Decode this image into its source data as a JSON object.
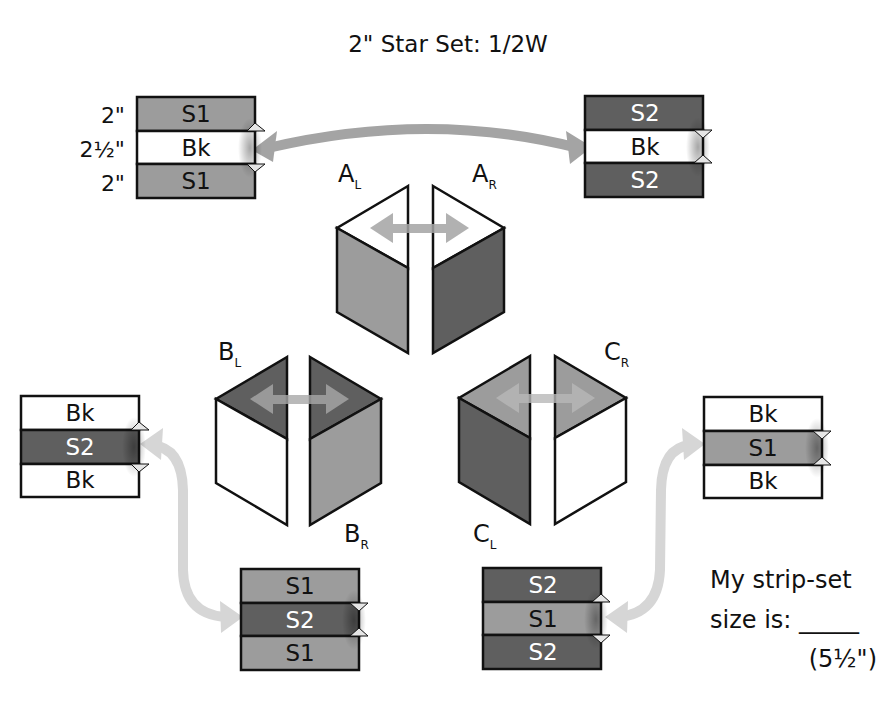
{
  "title": "2\" Star Set: 1/2W",
  "colors": {
    "s1": "#9c9c9c",
    "s2": "#5f5f5f",
    "bk": "#ffffff",
    "outline": "#111111",
    "arrow_dark": "#a4a4a4",
    "arrow_light": "#d4d4d4"
  },
  "dimensions": [
    "2\"",
    "2½\"",
    "2\""
  ],
  "units": {
    "A": {
      "left_label": "A",
      "left_sub": "L",
      "right_label": "A",
      "right_sub": "R"
    },
    "B": {
      "left_label": "B",
      "left_sub": "L",
      "right_label": "B",
      "right_sub": "R"
    },
    "C": {
      "left_label": "C",
      "left_sub": "L",
      "right_label": "C",
      "right_sub": "R"
    }
  },
  "strip_sets": [
    {
      "id": "top-left",
      "strips": [
        "S1",
        "Bk",
        "S1"
      ]
    },
    {
      "id": "top-right",
      "strips": [
        "S2",
        "Bk",
        "S2"
      ]
    },
    {
      "id": "mid-left",
      "strips": [
        "Bk",
        "S2",
        "Bk"
      ]
    },
    {
      "id": "mid-right",
      "strips": [
        "Bk",
        "S1",
        "Bk"
      ]
    },
    {
      "id": "bottom-left",
      "strips": [
        "S1",
        "S2",
        "S1"
      ]
    },
    {
      "id": "bottom-right",
      "strips": [
        "S2",
        "S1",
        "S2"
      ]
    }
  ],
  "note": {
    "line1": "My strip-set",
    "line2": "size is: _____",
    "line3": "(5½\")"
  }
}
